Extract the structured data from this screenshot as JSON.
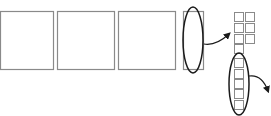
{
  "diagram": {
    "colors": {
      "square_stroke": "#8a8a8a",
      "ellipse_stroke": "#1a1a1a",
      "arrow_stroke": "#1a1a1a",
      "background": "#ffffff"
    },
    "large_squares": [
      {
        "x": 0,
        "y": 11,
        "w": 53,
        "h": 58
      },
      {
        "x": 57,
        "y": 11,
        "w": 57,
        "h": 58
      },
      {
        "x": 118,
        "y": 11,
        "w": 57,
        "h": 58
      }
    ],
    "narrow_strip": {
      "x": 183,
      "y": 11,
      "w": 20,
      "h": 58
    },
    "ellipse_strip": {
      "cx": 193,
      "cy": 40,
      "rx": 10,
      "ry": 33
    },
    "arrow_1": {
      "path": "M 204 44 Q 216 46 229 34"
    },
    "small_grid": [
      {
        "x": 234,
        "y": 12,
        "w": 9,
        "h": 9
      },
      {
        "x": 245,
        "y": 12,
        "w": 9,
        "h": 9
      },
      {
        "x": 234,
        "y": 23,
        "w": 9,
        "h": 9
      },
      {
        "x": 245,
        "y": 23,
        "w": 9,
        "h": 9
      },
      {
        "x": 234,
        "y": 34,
        "w": 9,
        "h": 9
      },
      {
        "x": 245,
        "y": 34,
        "w": 9,
        "h": 9
      },
      {
        "x": 234,
        "y": 44,
        "w": 9,
        "h": 9
      }
    ],
    "ellipse_column": {
      "cx": 239,
      "cy": 84,
      "rx": 10,
      "ry": 31
    },
    "column_squares": [
      {
        "x": 234,
        "y": 58,
        "w": 9,
        "h": 9
      },
      {
        "x": 234,
        "y": 69,
        "w": 9,
        "h": 9
      },
      {
        "x": 234,
        "y": 79,
        "w": 9,
        "h": 9
      },
      {
        "x": 234,
        "y": 89,
        "w": 9,
        "h": 9
      },
      {
        "x": 234,
        "y": 100,
        "w": 9,
        "h": 9
      }
    ],
    "arrow_2": {
      "path": "M 249 76 Q 262 74 268 91"
    }
  }
}
